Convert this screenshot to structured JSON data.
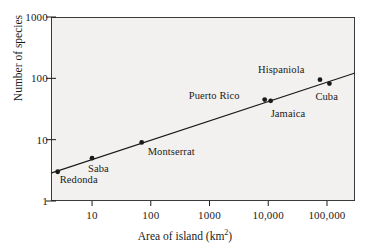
{
  "chart_data": {
    "type": "scatter",
    "title": "",
    "xlabel": "Area of island (km2)",
    "xlabel_base": "Area of island (km",
    "xlabel_sup": "2",
    "xlabel_tail": ")",
    "ylabel": "Number of species",
    "xscale": "log",
    "yscale": "log",
    "xlim": [
      2.0,
      300000
    ],
    "ylim": [
      1,
      1000
    ],
    "grid": false,
    "legend": "none",
    "xticks": [
      10,
      100,
      1000,
      10000,
      100000
    ],
    "xtick_labels": [
      "10",
      "100",
      "1000",
      "10,000",
      "100,000"
    ],
    "yticks": [
      1,
      10,
      100,
      1000
    ],
    "ytick_labels": [
      "1",
      "10",
      "100",
      "1000"
    ],
    "point_color": "#1a1a1a",
    "line_color": "#1a1a1a",
    "plot_bg": "#f2f1ef",
    "points": [
      {
        "name": "Redonda",
        "area": 2.6,
        "species": 3,
        "label_dx": 2,
        "label_dy": 9
      },
      {
        "name": "Saba",
        "area": 10,
        "species": 5,
        "label_dx": -4,
        "label_dy": 12
      },
      {
        "name": "Montserrat",
        "area": 70,
        "species": 9,
        "label_dx": 6,
        "label_dy": 11
      },
      {
        "name": "Puerto Rico",
        "area": 8700,
        "species": 45,
        "label_dx": -76,
        "label_dy": -3
      },
      {
        "name": "Jamaica",
        "area": 11000,
        "species": 43,
        "label_dx": 0,
        "label_dy": 14
      },
      {
        "name": "Hispaniola",
        "area": 76000,
        "species": 95,
        "label_dx": -62,
        "label_dy": -9
      },
      {
        "name": "Cuba",
        "area": 110000,
        "species": 82,
        "label_dx": -14,
        "label_dy": 14
      }
    ],
    "fit_line": {
      "description": "log-log regression line",
      "x_start": 2.0,
      "y_start": 2.85,
      "x_end": 300000,
      "y_end": 122
    }
  }
}
